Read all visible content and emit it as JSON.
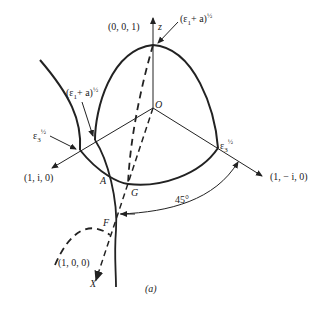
{
  "figure": {
    "caption": "(a)",
    "labels": {
      "z_axis": "z",
      "x_axis": "X",
      "origin": "O",
      "point_001": "(0, 0, 1)",
      "point_100": "(1, 0, 0)",
      "point_1i0": "(1, i, 0)",
      "point_1mi0": "(1, − i, 0)",
      "eps1_a_top": "(ε",
      "eps1_a_top_rest": "+ a)",
      "eps1_a_left": "(ε",
      "eps1_a_left_rest": "+ a)",
      "eps3_left": "ε",
      "eps3_right": "ε",
      "sub1": "1",
      "sub3": "3",
      "half": "½",
      "A": "A",
      "G": "G",
      "F": "F",
      "angle": "45°"
    }
  }
}
